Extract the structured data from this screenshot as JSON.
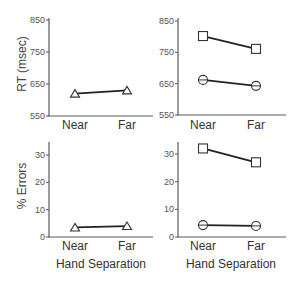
{
  "chart_data": [
    {
      "type": "line",
      "panel": "top-left",
      "ylabel": "RT (msec)",
      "xlabel": "",
      "categories": [
        "Near",
        "Far"
      ],
      "yticks": [
        550,
        650,
        750,
        850
      ],
      "ylim": [
        550,
        850
      ],
      "series": [
        {
          "name": "triangle",
          "marker": "triangle",
          "values": [
            620,
            630
          ]
        }
      ]
    },
    {
      "type": "line",
      "panel": "top-right",
      "ylabel": "",
      "xlabel": "",
      "categories": [
        "Near",
        "Far"
      ],
      "yticks": [
        550,
        650,
        750,
        850
      ],
      "ylim": [
        550,
        850
      ],
      "series": [
        {
          "name": "square",
          "marker": "square",
          "values": [
            802,
            761
          ]
        },
        {
          "name": "circle",
          "marker": "circle",
          "values": [
            662,
            643
          ]
        }
      ]
    },
    {
      "type": "line",
      "panel": "bottom-left",
      "ylabel": "% Errors",
      "xlabel": "Hand Separation",
      "categories": [
        "Near",
        "Far"
      ],
      "yticks": [
        0,
        10,
        20,
        30
      ],
      "ylim": [
        0,
        35
      ],
      "series": [
        {
          "name": "triangle",
          "marker": "triangle",
          "values": [
            3.5,
            4.0
          ]
        }
      ]
    },
    {
      "type": "line",
      "panel": "bottom-right",
      "ylabel": "",
      "xlabel": "Hand Separation",
      "categories": [
        "Near",
        "Far"
      ],
      "yticks": [
        0,
        10,
        20,
        30
      ],
      "ylim": [
        0,
        35
      ],
      "series": [
        {
          "name": "square",
          "marker": "square",
          "values": [
            32,
            27
          ]
        },
        {
          "name": "circle",
          "marker": "circle",
          "values": [
            4.3,
            4.0
          ]
        }
      ]
    }
  ],
  "labels": {
    "rt_ylabel": "RT (msec)",
    "err_ylabel": "% Errors",
    "xtitle": "Hand Separation",
    "near": "Near",
    "far": "Far",
    "rt_ticks": [
      "850",
      "750",
      "650",
      "550"
    ],
    "err_ticks": [
      "30",
      "20",
      "10",
      "0"
    ]
  }
}
